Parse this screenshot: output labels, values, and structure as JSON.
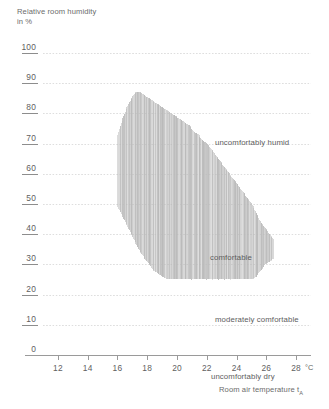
{
  "chart_data": {
    "type": "area",
    "title": "",
    "ylabel": "Relative room humidity\nin %",
    "xlabel": "Room air temperature t",
    "xlabel_sub": "A",
    "x_unit": "°C",
    "ylim": [
      0,
      100
    ],
    "xlim": [
      11,
      29
    ],
    "y_ticks": [
      100,
      90,
      80,
      70,
      60,
      50,
      40,
      30,
      20,
      10,
      0
    ],
    "x_ticks": [
      12,
      14,
      16,
      18,
      20,
      22,
      24,
      26,
      28
    ],
    "grid": "horizontal-dotted",
    "legend": "none",
    "annotations": [
      {
        "text": "uncomfortably humid",
        "x": 20.3,
        "y": 83
      },
      {
        "text": "comfortable",
        "x": 20.0,
        "y": 51
      },
      {
        "text": "moderately comfortable",
        "x": 20.3,
        "y": 31
      },
      {
        "text": "uncomfortably dry",
        "x": 20.1,
        "y": 12
      }
    ],
    "series": [
      {
        "name": "comfort zone envelope",
        "description": "Vertical hatched band: upper and lower relative humidity bounds versus room air temperature",
        "x": [
          16.0,
          16.3,
          16.6,
          16.9,
          17.2,
          17.5,
          17.8,
          18.1,
          18.4,
          18.7,
          19.0,
          19.3,
          19.6,
          19.9,
          20.2,
          20.5,
          20.8,
          21.1,
          21.4,
          21.7,
          22.0,
          22.3,
          22.6,
          22.9,
          23.2,
          23.5,
          23.8,
          24.1,
          24.4,
          24.7,
          25.0,
          25.3,
          25.6,
          25.9,
          26.2,
          26.5
        ],
        "upper": [
          73,
          78,
          82,
          85,
          87,
          87,
          86,
          85,
          84,
          83,
          82,
          81,
          80,
          79,
          78,
          77,
          76,
          74,
          73,
          71,
          70,
          68,
          66,
          64,
          62,
          60,
          58,
          56,
          54,
          52,
          50,
          47,
          44,
          42,
          40,
          38
        ],
        "lower": [
          49,
          46,
          43,
          40,
          37,
          34,
          32,
          30,
          28,
          27,
          26,
          25,
          25,
          25,
          25,
          25,
          25,
          25,
          25,
          25,
          25,
          25,
          25,
          25,
          25,
          25,
          25,
          25,
          25,
          25,
          25,
          26,
          28,
          30,
          31,
          32
        ]
      }
    ]
  },
  "axes": {
    "y_title": "Relative room humidity\nin %",
    "x_title": "Room air temperature t",
    "x_title_sub": "A",
    "degree_unit": "°C",
    "y_tick_labels": [
      "100",
      "90",
      "80",
      "70",
      "60",
      "50",
      "40",
      "30",
      "20",
      "10",
      "0"
    ],
    "x_tick_labels": [
      "12",
      "14",
      "16",
      "18",
      "20",
      "22",
      "24",
      "26",
      "28"
    ]
  },
  "zones": {
    "humid": "uncomfortably humid",
    "comfortable": "comfortable",
    "moderate": "moderately comfortable",
    "dry": "uncomfortably dry"
  },
  "colors": {
    "hatch": "#b9b9b9",
    "grid": "#dcdcdc",
    "axis": "#9a9a9a",
    "text": "#5f5f5f",
    "background": "#ffffff"
  }
}
